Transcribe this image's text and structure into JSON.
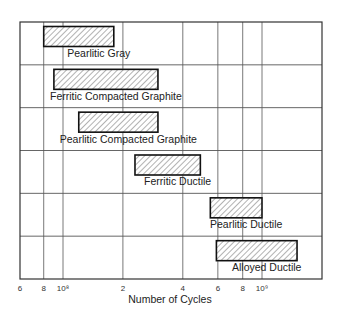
{
  "chart_data": {
    "type": "bar",
    "orientation": "horizontal-range",
    "title": "",
    "xlabel": "Number of Cycles",
    "ylabel": "",
    "xscale": "log",
    "xlim": [
      60000000,
      2200000000
    ],
    "grid": true,
    "legend": null,
    "x_ticks": [
      {
        "label": "6",
        "value": 60000000
      },
      {
        "label": "8",
        "value": 80000000
      },
      {
        "label": "10⁸",
        "value": 100000000
      },
      {
        "label": "2",
        "value": 200000000
      },
      {
        "label": "4",
        "value": 400000000
      },
      {
        "label": "6",
        "value": 600000000
      },
      {
        "label": "8",
        "value": 800000000
      },
      {
        "label": "10⁹",
        "value": 1000000000
      }
    ],
    "categories": [
      "Pearlitic Gray",
      "Ferritic Compacted Graphite",
      "Pearlitic Compacted Graphite",
      "Ferritic Ductile",
      "Pearlitic Ductile",
      "Alloyed Ductile"
    ],
    "series": [
      {
        "name": "Range start (cycles)",
        "values": [
          80000000,
          90000000,
          120000000,
          230000000,
          550000000,
          590000000
        ]
      },
      {
        "name": "Range end (cycles)",
        "values": [
          180000000,
          300000000,
          300000000,
          490000000,
          1000000000,
          1500000000
        ]
      }
    ],
    "bar_style": "diagonal hatch, black outline"
  },
  "colors": {
    "frame": "#333333",
    "grid": "#555555",
    "hatch": "#555555",
    "text": "#222222"
  }
}
